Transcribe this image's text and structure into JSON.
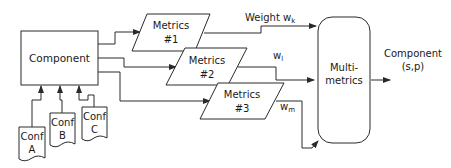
{
  "diagram": {
    "component": {
      "label": "Component"
    },
    "configs": [
      {
        "line1": "Conf",
        "line2": "A"
      },
      {
        "line1": "Conf",
        "line2": "B"
      },
      {
        "line1": "Conf",
        "line2": "C"
      }
    ],
    "metrics": [
      {
        "line1": "Metrics",
        "line2": "#1"
      },
      {
        "line1": "Metrics",
        "line2": "#2"
      },
      {
        "line1": "Metrics",
        "line2": "#3"
      }
    ],
    "weights": [
      {
        "prefix": "Weight w",
        "sub": "k"
      },
      {
        "prefix": "w",
        "sub": "l"
      },
      {
        "prefix": "w",
        "sub": "m"
      }
    ],
    "multi_metrics": {
      "line1": "Multi-",
      "line2": "metrics"
    },
    "output": {
      "line1": "Component",
      "line2": "(s,p)"
    }
  }
}
